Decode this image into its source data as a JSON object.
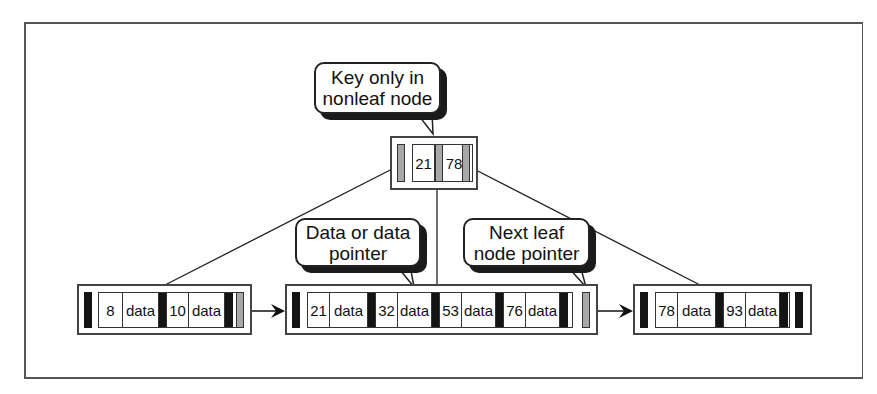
{
  "diagram": {
    "callouts": [
      {
        "id": "key-only",
        "text": "Key only in\nnonleaf node"
      },
      {
        "id": "data-pointer",
        "text": "Data or data\npointer"
      },
      {
        "id": "next-leaf",
        "text": "Next leaf\nnode pointer"
      }
    ],
    "root": {
      "keys": [
        "21",
        "78"
      ]
    },
    "leaves": [
      {
        "entries": [
          {
            "key": "8",
            "data": "data"
          },
          {
            "key": "10",
            "data": "data"
          }
        ]
      },
      {
        "entries": [
          {
            "key": "21",
            "data": "data"
          },
          {
            "key": "32",
            "data": "data"
          },
          {
            "key": "53",
            "data": "data"
          },
          {
            "key": "76",
            "data": "data"
          }
        ]
      },
      {
        "entries": [
          {
            "key": "78",
            "data": "data"
          },
          {
            "key": "93",
            "data": "data"
          }
        ]
      }
    ],
    "colors": {
      "pointer_gray": "#a8a8a8",
      "pointer_black": "#141414",
      "line": "#222222"
    }
  }
}
